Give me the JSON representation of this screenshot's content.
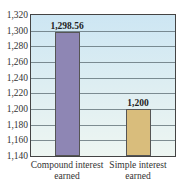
{
  "chart_data": {
    "type": "bar",
    "title": "",
    "xlabel": "",
    "ylabel": "",
    "categories": [
      "Compound interest earned",
      "Simple interest earned"
    ],
    "category_lines": [
      [
        "Compound interest",
        "earned"
      ],
      [
        "Simple interest",
        "earned"
      ]
    ],
    "values": [
      1298.56,
      1200
    ],
    "value_labels": [
      "1,298.56",
      "1,200"
    ],
    "colors": [
      "#8e86b4",
      "#d9bd7c"
    ],
    "ylim": [
      1140,
      1320
    ],
    "yticks": [
      1140,
      1160,
      1180,
      1200,
      1220,
      1240,
      1260,
      1280,
      1300,
      1320
    ],
    "ytick_labels": [
      "1,140",
      "1,160",
      "1,180",
      "1,200",
      "1,220",
      "1,240",
      "1,260",
      "1,280",
      "1,300",
      "1,320"
    ],
    "grid": true,
    "legend": null
  }
}
